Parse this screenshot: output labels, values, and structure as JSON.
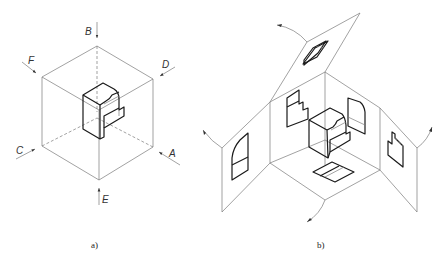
{
  "figure": {
    "panel_a": {
      "caption": "a)",
      "view_labels": {
        "A": "A",
        "B": "B",
        "C": "C",
        "D": "D",
        "E": "E",
        "F": "F"
      },
      "description": "Object inside transparent projection cube with six viewing directions"
    },
    "panel_b": {
      "caption": "b)",
      "description": "Projection planes unfolded around the object showing views on each plane"
    }
  }
}
